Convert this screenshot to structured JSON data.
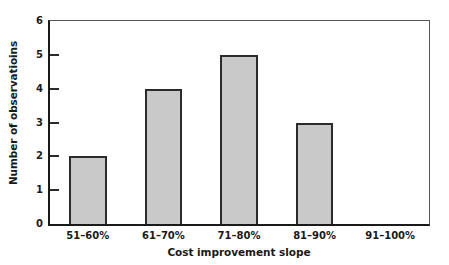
{
  "chart_data": {
    "type": "bar",
    "title": "",
    "subtitle": "",
    "xlabel": "Cost improvement slope",
    "ylabel": "Number of observatioins",
    "categories": [
      "51–60%",
      "61–70%",
      "71–80%",
      "81–90%",
      "91–100%"
    ],
    "values": [
      2,
      4,
      5,
      3,
      0
    ],
    "series": [
      {
        "name": "Number of observatioins",
        "values": [
          2,
          4,
          5,
          3,
          0
        ]
      }
    ],
    "ylim": [
      0,
      6
    ],
    "yticks": [
      0,
      1,
      2,
      3,
      4,
      5,
      6
    ],
    "ytick_labels": [
      "0",
      "1",
      "2",
      "3",
      "4",
      "5",
      "6"
    ],
    "grid": false,
    "legend": false,
    "legend_position": "none",
    "bar_fill_color": "#c9c9c9",
    "bar_edge_color": "#2b2b2b",
    "axis_color": "#1a1a1a",
    "background_color": "#ffffff",
    "text_color": "#1a1a1a"
  }
}
